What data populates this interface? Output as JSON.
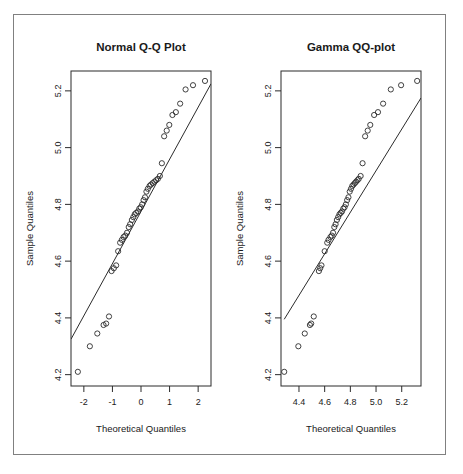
{
  "figure": {
    "background_color": "#ffffff",
    "frame_color": "#808080",
    "ink_color": "#2b2b2b"
  },
  "chart_data": [
    {
      "type": "scatter",
      "id": "normal-qq-plot",
      "title": "Normal Q-Q Plot",
      "xlabel": "Theoretical Quantiles",
      "ylabel": "Sample Quantiles",
      "grid": false,
      "legend": "none",
      "xlim": [
        -2.45,
        2.45
      ],
      "ylim": [
        4.16,
        5.27
      ],
      "xticks": [
        -2,
        -1,
        0,
        1,
        2
      ],
      "xtick_labels": [
        "-2",
        "-1",
        "0",
        "1",
        "2"
      ],
      "yticks": [
        4.2,
        4.4,
        4.6,
        4.8,
        5.0,
        5.2
      ],
      "ytick_labels": [
        "4.2",
        "4.4",
        "4.6",
        "4.8",
        "5.0",
        "5.2"
      ],
      "reference_line": {
        "description": "qqline through first and third quartiles",
        "x": [
          -2.45,
          2.45
        ],
        "y": [
          4.325,
          5.225
        ]
      },
      "x": [
        -2.21,
        -1.79,
        -1.53,
        -1.31,
        -1.22,
        -1.12,
        -1.03,
        -0.95,
        -0.87,
        -0.8,
        -0.73,
        -0.67,
        -0.61,
        -0.55,
        -0.49,
        -0.43,
        -0.38,
        -0.32,
        -0.27,
        -0.22,
        -0.17,
        -0.11,
        -0.06,
        -0.01,
        0.04,
        0.09,
        0.14,
        0.19,
        0.24,
        0.3,
        0.35,
        0.41,
        0.47,
        0.53,
        0.59,
        0.66,
        0.73,
        0.81,
        0.9,
        0.99,
        1.1,
        1.22,
        1.37,
        1.56,
        1.82,
        2.24
      ],
      "y": [
        4.21,
        4.3,
        4.345,
        4.375,
        4.38,
        4.405,
        4.565,
        4.575,
        4.585,
        4.635,
        4.665,
        4.675,
        4.685,
        4.69,
        4.7,
        4.72,
        4.73,
        4.745,
        4.755,
        4.765,
        4.77,
        4.775,
        4.785,
        4.79,
        4.8,
        4.815,
        4.825,
        4.845,
        4.855,
        4.865,
        4.87,
        4.875,
        4.88,
        4.885,
        4.89,
        4.9,
        4.945,
        5.04,
        5.06,
        5.08,
        5.115,
        5.125,
        5.155,
        5.205,
        5.22,
        5.235
      ]
    },
    {
      "type": "scatter",
      "id": "gamma-qq-plot",
      "title": "Gamma QQ-plot",
      "xlabel": "Theoretical Quantiles",
      "ylabel": "Sample Quantiles",
      "grid": false,
      "legend": "none",
      "xlim": [
        4.26,
        5.35
      ],
      "ylim": [
        4.16,
        5.27
      ],
      "xticks": [
        4.4,
        4.6,
        4.8,
        5.0,
        5.2
      ],
      "xtick_labels": [
        "4.4",
        "4.6",
        "4.8",
        "5.0",
        "5.2"
      ],
      "yticks": [
        4.2,
        4.4,
        4.6,
        4.8,
        5.0,
        5.2
      ],
      "ytick_labels": [
        "4.2",
        "4.4",
        "4.6",
        "4.8",
        "5.0",
        "5.2"
      ],
      "reference_line": {
        "description": "qqline through first and third quartiles",
        "x": [
          4.285,
          5.35
        ],
        "y": [
          4.395,
          5.175
        ]
      },
      "x": [
        4.285,
        4.395,
        4.445,
        4.485,
        4.495,
        4.515,
        4.555,
        4.565,
        4.575,
        4.6,
        4.62,
        4.63,
        4.645,
        4.655,
        4.665,
        4.675,
        4.685,
        4.695,
        4.705,
        4.715,
        4.725,
        4.735,
        4.745,
        4.755,
        4.765,
        4.775,
        4.785,
        4.795,
        4.805,
        4.815,
        4.825,
        4.835,
        4.845,
        4.855,
        4.865,
        4.88,
        4.895,
        4.915,
        4.935,
        4.955,
        4.985,
        5.015,
        5.055,
        5.115,
        5.195,
        5.32
      ],
      "y": [
        4.21,
        4.3,
        4.345,
        4.375,
        4.38,
        4.405,
        4.565,
        4.575,
        4.585,
        4.635,
        4.665,
        4.675,
        4.685,
        4.69,
        4.7,
        4.72,
        4.73,
        4.745,
        4.755,
        4.765,
        4.77,
        4.775,
        4.785,
        4.79,
        4.8,
        4.815,
        4.825,
        4.845,
        4.855,
        4.865,
        4.87,
        4.875,
        4.88,
        4.885,
        4.89,
        4.9,
        4.945,
        5.04,
        5.06,
        5.08,
        5.115,
        5.125,
        5.155,
        5.205,
        5.22,
        5.235
      ]
    }
  ]
}
